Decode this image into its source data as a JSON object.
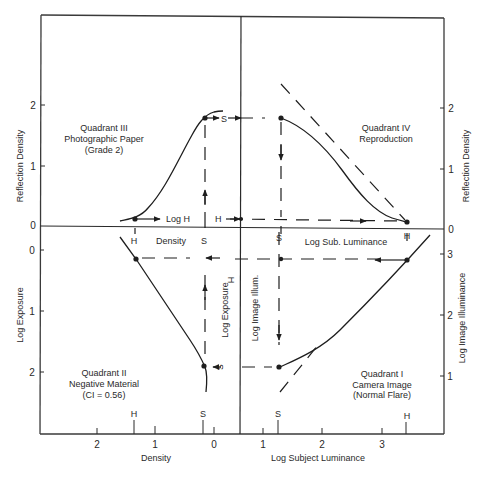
{
  "quadrants": {
    "q1": {
      "title": "Quadrant I",
      "subtitle": "Camera Image",
      "note": "(Normal Flare)"
    },
    "q2": {
      "title": "Quadrant II",
      "subtitle": "Negative Material",
      "note": "(CI = 0.56)"
    },
    "q3": {
      "title": "Quadrant III",
      "subtitle": "Photographic Paper",
      "note": "(Grade 2)"
    },
    "q4": {
      "title": "Quadrant IV",
      "subtitle": "Reproduction"
    }
  },
  "axes": {
    "left_upper_label": "Reflection Density",
    "left_lower_label": "Log Exposure",
    "right_upper_label": "Reflection Density",
    "right_lower_label": "Log Image Illuminance",
    "bottom_left_label": "Density",
    "bottom_right_label": "Log Subject Luminance",
    "inner_density_label": "Density",
    "inner_log_h_label": "Log H",
    "inner_log_exposure_label": "Log Exposure",
    "inner_log_image_illum_label": "Log Image Illum.",
    "inner_log_sub_lum_label": "Log Sub. Luminance",
    "left_upper_ticks": [
      "2",
      "1",
      "0"
    ],
    "left_lower_ticks": [
      "0",
      "1",
      "2"
    ],
    "right_upper_ticks": [
      "2",
      "1",
      "0"
    ],
    "right_lower_ticks": [
      "3",
      "2",
      "1"
    ],
    "bottom_left_ticks": [
      "2",
      "1",
      "0"
    ],
    "bottom_right_ticks": [
      "1",
      "2",
      "3"
    ]
  },
  "markers": {
    "shadow": "S",
    "highlight": "H"
  },
  "colors": {
    "line": "#1e1e1e",
    "frame": "#3a3a3a",
    "text": "#2a2a2a"
  }
}
